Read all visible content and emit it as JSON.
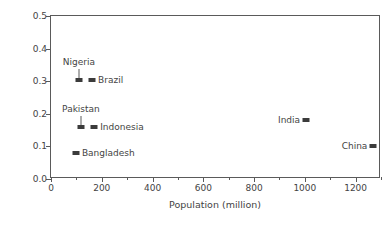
{
  "chart_data": {
    "type": "scatter",
    "title": "",
    "xlabel": "Population (million)",
    "ylabel": "Farm land (ha/capita)",
    "xlim": [
      0,
      1300
    ],
    "ylim": [
      0.0,
      0.5
    ],
    "grid": false,
    "legend": "none",
    "xticks": [
      0,
      200,
      400,
      600,
      800,
      1000,
      1200
    ],
    "xtick_labels": [
      "0",
      "200",
      "400",
      "600",
      "800",
      "1000",
      "1200"
    ],
    "xminor_ticks": [
      100,
      300,
      500,
      700,
      900,
      1100,
      1300
    ],
    "yticks": [
      0.0,
      0.1,
      0.2,
      0.3,
      0.4,
      0.5
    ],
    "ytick_labels": [
      "0.0",
      "0.1",
      "0.2",
      "0.3",
      "0.4",
      "0.5"
    ],
    "marker_color": "#3b3b3b",
    "axis_color": "#5a5a5a",
    "text_color": "#444444",
    "points": [
      {
        "name": "Nigeria",
        "x": 110,
        "y": 0.305,
        "label": "Nigeria",
        "label_pos": "above",
        "leader": true
      },
      {
        "name": "Brazil",
        "x": 162,
        "y": 0.305,
        "label": "Brazil",
        "label_pos": "right",
        "leader": false
      },
      {
        "name": "Pakistan",
        "x": 118,
        "y": 0.16,
        "label": "Pakistan",
        "label_pos": "above",
        "leader": true
      },
      {
        "name": "Indonesia",
        "x": 170,
        "y": 0.16,
        "label": "Indonesia",
        "label_pos": "right",
        "leader": false
      },
      {
        "name": "Bangladesh",
        "x": 98,
        "y": 0.08,
        "label": "Bangladesh",
        "label_pos": "right",
        "leader": false
      },
      {
        "name": "India",
        "x": 1005,
        "y": 0.18,
        "label": "India",
        "label_pos": "left",
        "leader": false
      },
      {
        "name": "China",
        "x": 1270,
        "y": 0.1,
        "label": "China",
        "label_pos": "left",
        "leader": false
      }
    ]
  }
}
